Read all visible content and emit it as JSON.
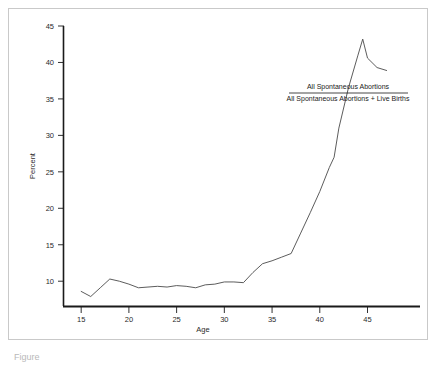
{
  "figure": {
    "caption": "Figure"
  },
  "chart_data": {
    "type": "line",
    "title": "",
    "xlabel": "Age",
    "ylabel": "Percent",
    "xlim": [
      13.2,
      50.5
    ],
    "ylim": [
      6.6,
      45
    ],
    "grid": false,
    "legend_position": "inside-upper-right",
    "legend": {
      "numerator": "All Spontaneous Abortions",
      "denominator": "All Spontaneous Abortions + Live Births"
    },
    "xticks": [
      15,
      20,
      25,
      30,
      35,
      40,
      45
    ],
    "xtick_labels": [
      "15",
      "20",
      "25",
      "30",
      "35",
      "40",
      "45"
    ],
    "yticks": [
      10,
      15,
      20,
      25,
      30,
      35,
      40,
      45
    ],
    "ytick_labels": [
      "10",
      "15",
      "20",
      "25",
      "30",
      "35",
      "40",
      "45"
    ],
    "series": [
      {
        "name": "All Spontaneous Abortions / (All Spontaneous Abortions + Live Births)",
        "color": "#4a4a4a",
        "x": [
          15,
          16,
          17,
          18,
          19,
          20,
          21,
          22,
          23,
          24,
          25,
          26,
          27,
          28,
          29,
          30,
          31,
          32,
          33,
          34,
          35,
          36,
          37,
          38,
          39,
          40,
          41,
          41.5,
          42,
          43,
          44,
          44.5,
          45,
          46,
          47
        ],
        "y": [
          8.6,
          7.9,
          9.1,
          10.3,
          10.0,
          9.6,
          9.1,
          9.2,
          9.3,
          9.2,
          9.4,
          9.3,
          9.1,
          9.5,
          9.6,
          9.9,
          9.9,
          9.8,
          11.2,
          12.4,
          12.8,
          13.3,
          13.8,
          16.6,
          19.4,
          22.3,
          25.6,
          27.0,
          31.0,
          36.5,
          41.0,
          43.2,
          40.6,
          39.3,
          38.9
        ]
      }
    ]
  }
}
